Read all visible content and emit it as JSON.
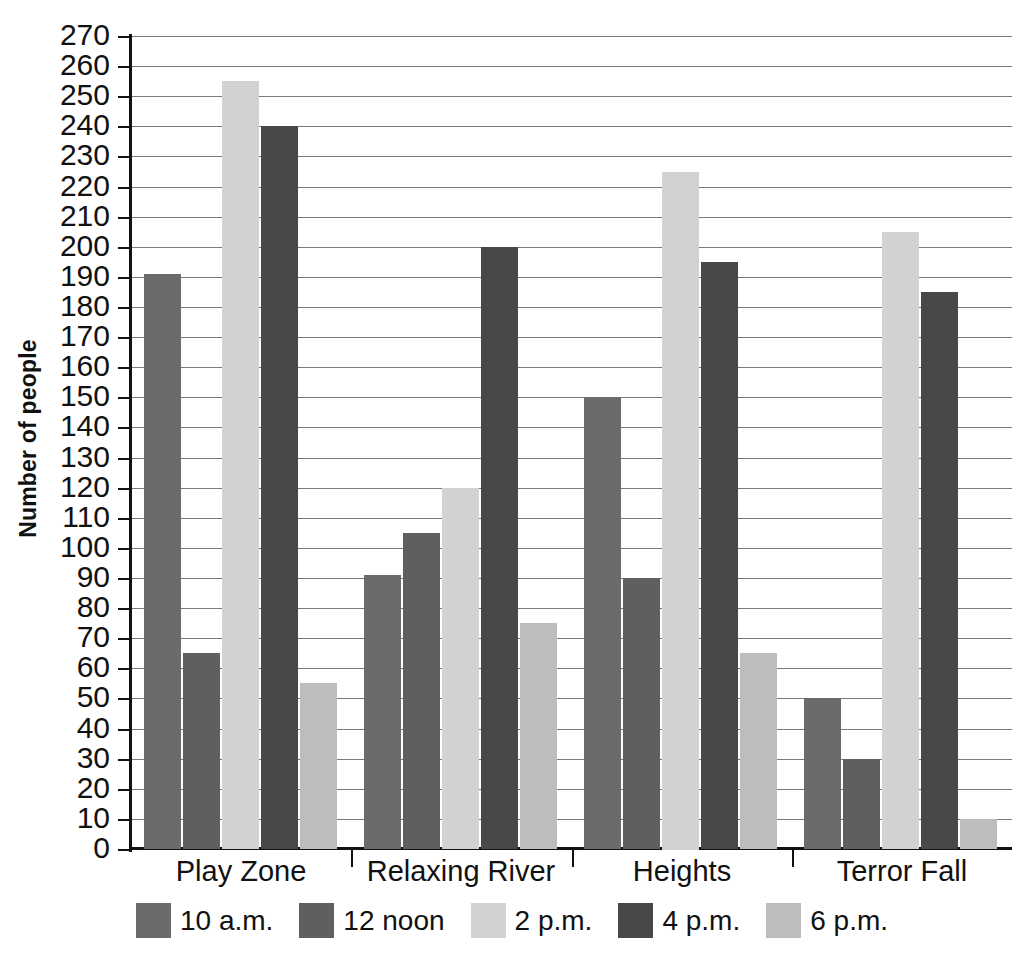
{
  "chart_data": {
    "type": "bar",
    "title": "",
    "xlabel": "",
    "ylabel": "Number of people",
    "ylim": [
      0,
      270
    ],
    "ytick_step": 10,
    "grid": true,
    "legend_position": "bottom",
    "categories": [
      "Play Zone",
      "Relaxing River",
      "Heights",
      "Terror Fall"
    ],
    "ytick_labels": [
      "270",
      "260",
      "250",
      "240",
      "230",
      "220",
      "210",
      "200",
      "190",
      "180",
      "170",
      "160",
      "150",
      "140",
      "130",
      "120",
      "110",
      "100",
      "90",
      "80",
      "70",
      "60",
      "50",
      "40",
      "30",
      "20",
      "10",
      "0"
    ],
    "series": [
      {
        "name": "10 a.m.",
        "color": "#6b6b6b",
        "values": [
          191,
          91,
          150,
          50
        ]
      },
      {
        "name": "12 noon",
        "color": "#5f5f5f",
        "values": [
          65,
          105,
          90,
          30
        ]
      },
      {
        "name": "2 p.m.",
        "color": "#d2d2d2",
        "values": [
          255,
          120,
          225,
          205
        ]
      },
      {
        "name": "4 p.m.",
        "color": "#484848",
        "values": [
          240,
          200,
          195,
          185
        ]
      },
      {
        "name": "6 p.m.",
        "color": "#bdbdbd",
        "values": [
          55,
          75,
          65,
          10
        ]
      }
    ]
  },
  "axis": {
    "y_title": "Number of people"
  }
}
